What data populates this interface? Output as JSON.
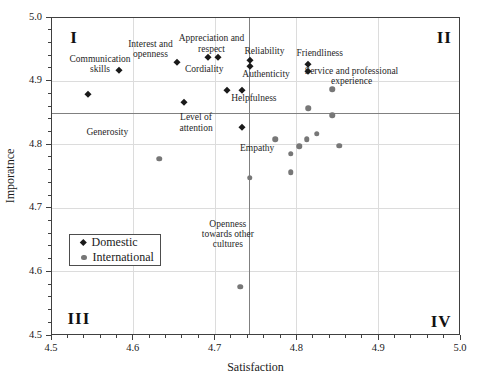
{
  "chart_data": {
    "type": "scatter",
    "title": "",
    "xlabel": "Satisfaction",
    "ylabel": "Imporatnce",
    "xlim": [
      4.5,
      5.0
    ],
    "ylim": [
      4.5,
      5.0
    ],
    "x_major_step": 0.1,
    "x_minor_step": 0.02,
    "y_major_step": 0.1,
    "y_minor_step": 0.02,
    "grid": "on",
    "legend_position": "inside-lower-left",
    "crosshair": {
      "x": 4.742,
      "y": 4.85
    },
    "quadrant_labels": [
      {
        "text": "I",
        "x": 4.527,
        "y": 4.969
      },
      {
        "text": "II",
        "x": 4.982,
        "y": 4.968
      },
      {
        "text": "III",
        "x": 4.533,
        "y": 4.524
      },
      {
        "text": "IV",
        "x": 4.978,
        "y": 4.519
      }
    ],
    "series": [
      {
        "name": "Domestic",
        "marker": "diamond",
        "color": "#1a1a1a",
        "points": [
          [
            4.544,
            4.879
          ],
          [
            4.582,
            4.918
          ],
          [
            4.654,
            4.93
          ],
          [
            4.662,
            4.867
          ],
          [
            4.692,
            4.938
          ],
          [
            4.704,
            4.938
          ],
          [
            4.715,
            4.886
          ],
          [
            4.734,
            4.886
          ],
          [
            4.743,
            4.933
          ],
          [
            4.743,
            4.924
          ],
          [
            4.733,
            4.828
          ],
          [
            4.815,
            4.928
          ],
          [
            4.815,
            4.916
          ]
        ]
      },
      {
        "name": "International",
        "marker": "circle",
        "color": "#777777",
        "points": [
          [
            4.632,
            4.777
          ],
          [
            4.731,
            4.575
          ],
          [
            4.743,
            4.747
          ],
          [
            4.774,
            4.808
          ],
          [
            4.793,
            4.785
          ],
          [
            4.793,
            4.756
          ],
          [
            4.804,
            4.797
          ],
          [
            4.813,
            4.808
          ],
          [
            4.815,
            4.857
          ],
          [
            4.825,
            4.817
          ],
          [
            4.844,
            4.887
          ],
          [
            4.844,
            4.846
          ],
          [
            4.853,
            4.798
          ]
        ]
      }
    ],
    "annotations": [
      {
        "text": "Communication skills",
        "lines": [
          "Communication",
          "skills"
        ],
        "x": 4.559,
        "y": 4.928
      },
      {
        "text": "Interest and openness",
        "lines": [
          "Interest and",
          "openness"
        ],
        "x": 4.621,
        "y": 4.951
      },
      {
        "text": "Appreciation and respect",
        "lines": [
          "Appreciation and",
          "respect"
        ],
        "x": 4.696,
        "y": 4.96
      },
      {
        "text": "Cordiality",
        "lines": [
          "Cordiality"
        ],
        "x": 4.687,
        "y": 4.92
      },
      {
        "text": "Reliability",
        "lines": [
          "Reliability"
        ],
        "x": 4.761,
        "y": 4.948
      },
      {
        "text": "Authenticity",
        "lines": [
          "Authenticity"
        ],
        "x": 4.763,
        "y": 4.911
      },
      {
        "text": "Friendliness",
        "lines": [
          "Friendliness"
        ],
        "x": 4.829,
        "y": 4.944
      },
      {
        "text": "Service and professional experience",
        "lines": [
          "Service and professional",
          "experience"
        ],
        "x": 4.868,
        "y": 4.909
      },
      {
        "text": "Helpfulness",
        "lines": [
          "Helpfulness"
        ],
        "x": 4.748,
        "y": 4.874
      },
      {
        "text": "Level of attention",
        "lines": [
          "Level of",
          "attention"
        ],
        "x": 4.677,
        "y": 4.835
      },
      {
        "text": "Generosity",
        "lines": [
          "Generosity"
        ],
        "x": 4.568,
        "y": 4.82
      },
      {
        "text": "Empathy",
        "lines": [
          "Empathy"
        ],
        "x": 4.752,
        "y": 4.795
      },
      {
        "text": "Openness towards other cultures",
        "lines": [
          "Openness",
          "towards other",
          "cultures"
        ],
        "x": 4.716,
        "y": 4.659
      }
    ]
  },
  "legend": {
    "items": [
      {
        "label": "Domestic"
      },
      {
        "label": "International"
      }
    ]
  },
  "colors": {
    "domestic": "#1a1a1a",
    "international": "#777777",
    "gridline": "#dcdcdc",
    "crosshair": "#808080",
    "axis": "#404040",
    "text": "#1a1a1a",
    "background": "#ffffff"
  }
}
